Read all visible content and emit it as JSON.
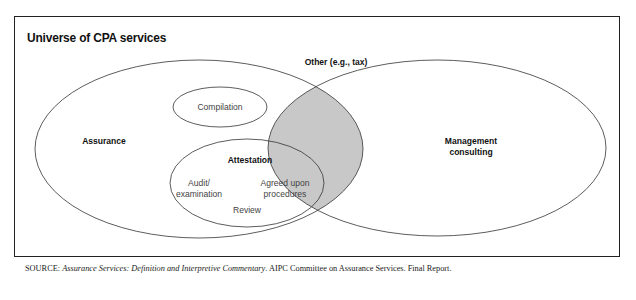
{
  "title": "Universe of CPA services",
  "diagram": {
    "type": "venn",
    "sets": [
      {
        "id": "assurance",
        "label": "Assurance"
      },
      {
        "id": "management_consulting",
        "label": "Management consulting"
      },
      {
        "id": "other",
        "label": "Other (e.g., tax)"
      },
      {
        "id": "compilation",
        "label": "Compilation",
        "parent": "assurance"
      },
      {
        "id": "attestation",
        "label": "Attestation",
        "parent": "assurance"
      }
    ],
    "attestation_items": {
      "audit": "Audit/",
      "audit2": "examination",
      "agreed": "Agreed upon",
      "agreed2": "procedures",
      "review": "Review"
    },
    "shaded_region": "assurance ∩ management consulting",
    "colors": {
      "stroke": "#333333",
      "shade": "#c8c8c8"
    }
  },
  "source": {
    "prefix": "SOURCE:",
    "italic": "Assurance Services: Definition and Interpretive Commentary",
    "rest": ". AIPC Committee on Assurance Services. Final Report."
  }
}
